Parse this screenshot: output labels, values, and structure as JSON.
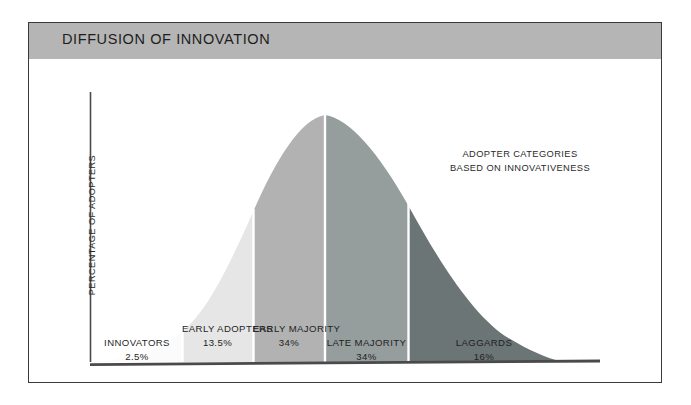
{
  "title": "DIFFUSION OF INNOVATION",
  "axis": {
    "y_label": "PERCENTAGE OF ADOPTERS"
  },
  "annotation": {
    "line1": "ADOPTER CATEGORIES",
    "line2": "BASED ON INNOVATIVENESS"
  },
  "colors": {
    "title_band": "#b5b5b5",
    "frame_border": "#3a3a3a",
    "axis_line": "#4a4a4a",
    "divider": "#ffffff",
    "background": "#ffffff"
  },
  "chart_data": {
    "type": "area",
    "title": "DIFFUSION OF INNOVATION",
    "subtitle": "ADOPTER CATEGORIES BASED ON INNOVATIVENESS",
    "xlabel": "",
    "ylabel": "PERCENTAGE OF ADOPTERS",
    "grid": false,
    "legend": "none",
    "curve": "normal-distribution bell curve",
    "categories": [
      "INNOVATORS",
      "EARLY ADOPTERS",
      "EARLY MAJORITY",
      "LATE MAJORITY",
      "LAGGARDS"
    ],
    "values": [
      2.5,
      13.5,
      34,
      34,
      16
    ],
    "value_labels": [
      "2.5%",
      "13.5%",
      "34%",
      "34%",
      "16%"
    ],
    "segment_colors": [
      "#fbfbfb",
      "#e6e6e6",
      "#b2b2b2",
      "#959d9d",
      "#6c7576"
    ],
    "segments": [
      {
        "label": "INNOVATORS",
        "percent": "2.5%",
        "value": 2.5,
        "color": "#fbfbfb",
        "x_start": 90,
        "x_end": 182
      },
      {
        "label": "EARLY ADOPTERS",
        "percent": "13.5%",
        "value": 13.5,
        "color": "#e6e6e6",
        "x_start": 182,
        "x_end": 253
      },
      {
        "label": "EARLY MAJORITY",
        "percent": "34%",
        "value": 34,
        "color": "#b2b2b2",
        "x_start": 253,
        "x_end": 325
      },
      {
        "label": "LATE MAJORITY",
        "percent": "34%",
        "value": 34,
        "color": "#959d9d",
        "x_start": 325,
        "x_end": 408
      },
      {
        "label": "LAGGARDS",
        "percent": "16%",
        "value": 16,
        "color": "#6c7576",
        "x_start": 408,
        "x_end": 560
      }
    ],
    "peak_x": 325,
    "baseline_y": 362,
    "axis_x": 90
  }
}
